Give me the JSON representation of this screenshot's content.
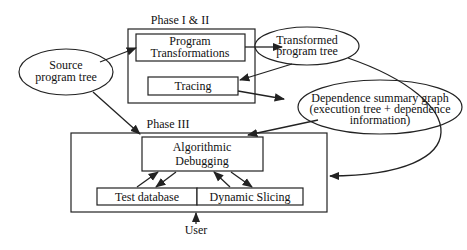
{
  "diagram": {
    "groups": [
      {
        "id": "phase12",
        "label": "Phase I & II"
      },
      {
        "id": "phase3",
        "label": "Phase III"
      }
    ],
    "nodes": {
      "source": {
        "lines": [
          "Source",
          "program tree"
        ],
        "shape": "ellipse"
      },
      "transformations": {
        "lines": [
          "Program",
          "Transformations"
        ],
        "shape": "box",
        "group": "phase12"
      },
      "tracing": {
        "lines": [
          "Tracing"
        ],
        "shape": "box",
        "group": "phase12"
      },
      "transformed": {
        "lines": [
          "Transformed",
          "program tree"
        ],
        "shape": "ellipse"
      },
      "dsg": {
        "lines": [
          "Dependence summary graph",
          "(execution tree + dependence",
          "information)"
        ],
        "shape": "ellipse"
      },
      "algdebug": {
        "lines": [
          "Algorithmic",
          "Debugging"
        ],
        "shape": "box",
        "group": "phase3"
      },
      "testdb": {
        "lines": [
          "Test database"
        ],
        "shape": "box",
        "group": "phase3"
      },
      "slicing": {
        "lines": [
          "Dynamic Slicing"
        ],
        "shape": "box",
        "group": "phase3"
      },
      "user": {
        "lines": [
          "User"
        ],
        "shape": "text"
      }
    },
    "edges": [
      {
        "from": "source",
        "to": "transformations"
      },
      {
        "from": "source",
        "to": "phase3"
      },
      {
        "from": "transformations",
        "to": "transformed"
      },
      {
        "from": "transformed",
        "to": "tracing"
      },
      {
        "from": "transformed",
        "to": "phase3"
      },
      {
        "from": "tracing",
        "to": "dsg"
      },
      {
        "from": "dsg",
        "to": "algdebug"
      },
      {
        "from": "algdebug",
        "to": "testdb",
        "bidirectional": true
      },
      {
        "from": "algdebug",
        "to": "slicing",
        "bidirectional": true
      },
      {
        "from": "user",
        "to": "phase3"
      }
    ]
  }
}
